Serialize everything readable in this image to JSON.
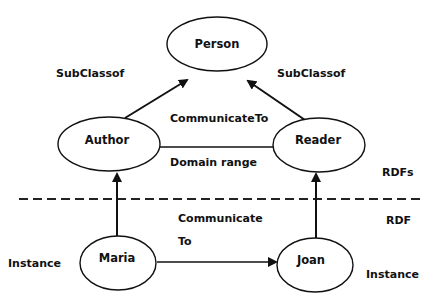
{
  "diagram": {
    "nodes": {
      "person": {
        "label": "Person"
      },
      "author": {
        "label": "Author"
      },
      "reader": {
        "label": "Reader"
      },
      "maria": {
        "label": "Maria"
      },
      "joan": {
        "label": "Joan"
      }
    },
    "edge_labels": {
      "subclass_left": "SubClassof",
      "subclass_right": "SubClassof",
      "communicate_to_schema": "CommunicateTo",
      "domain_range": "Domain range",
      "communicate_instance_line1": "Communicate",
      "communicate_instance_line2": "To"
    },
    "layer_labels": {
      "rdfs": "RDFs",
      "rdf": "RDF",
      "instance_left": "Instance",
      "instance_right": "Instance"
    },
    "colors": {
      "stroke": "#111111",
      "background": "#ffffff"
    }
  }
}
